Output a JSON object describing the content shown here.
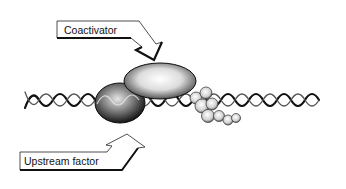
{
  "diagram": {
    "labels": {
      "coactivator": "Coactivator",
      "upstream_factor": "Upstream factor"
    },
    "colors": {
      "background": "#ffffff",
      "ink": "#111111",
      "protein_dark": "#2a2a2a",
      "protein_light": "#e8e8e8"
    }
  }
}
